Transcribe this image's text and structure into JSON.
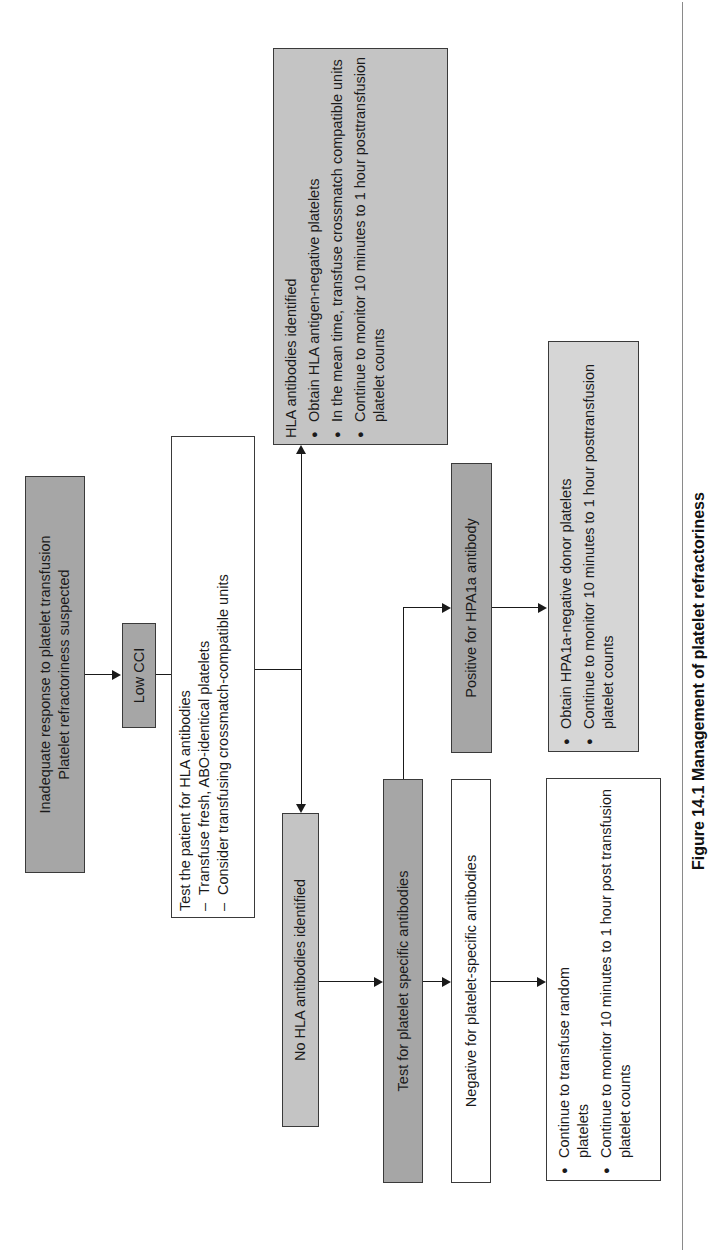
{
  "flowchart": {
    "start": {
      "line1": "Inadequate response to platelet transfusion",
      "line2": "Platelet refractoriness suspected"
    },
    "low_cci": "Low CCI",
    "test_hla": {
      "title": "Test the patient for HLA antibodies",
      "items": [
        "Transfuse fresh, ABO-identical platelets",
        "Consider transfusing crossmatch-compatible units"
      ]
    },
    "hla_identified": {
      "title": "HLA antibodies identified",
      "items": [
        "Obtain HLA antigen-negative platelets",
        "In the mean time, transfuse crossmatch compatible units",
        "Continue to monitor 10 minutes to 1 hour posttransfusion platelet counts"
      ]
    },
    "no_hla": "No HLA antibodies identified",
    "test_platelet_specific": "Test for platelet specific antibodies",
    "positive_hpa1a": "Positive for HPA1a antibody",
    "negative_platelet_specific": "Negative for platelet-specific antibodies",
    "hpa1a_actions": {
      "items": [
        "Obtain HPA1a-negative donor platelets",
        "Continue to monitor 10 minutes to 1 hour posttransfusion platelet counts"
      ]
    },
    "negative_actions": {
      "items": [
        "Continue to transfuse random platelets",
        "Continue to monitor 10 minutes to 1 hour post transfusion platelet counts"
      ]
    }
  },
  "caption": "Figure 14.1 Management of platelet refractoriness"
}
